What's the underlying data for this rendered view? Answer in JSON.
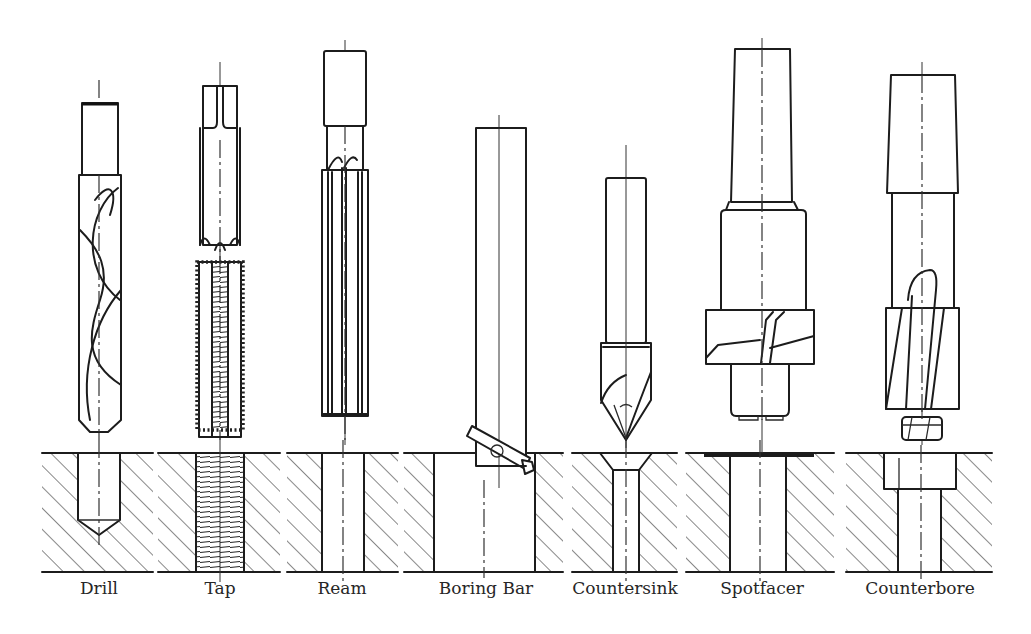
{
  "figure": {
    "title": "",
    "colors": {
      "line": "#1c1c1c",
      "hatch": "#555555",
      "background": "#ffffff",
      "label": "#262626"
    }
  },
  "tools": [
    {
      "id": "drill",
      "label": "Drill",
      "center_x": 99,
      "workpiece_x": [
        42,
        153
      ],
      "hole": "blind hole with conical bottom"
    },
    {
      "id": "tap",
      "label": "Tap",
      "center_x": 220,
      "workpiece_x": [
        158,
        280
      ],
      "hole": "threaded through hole"
    },
    {
      "id": "ream",
      "label": "Ream",
      "center_x": 341,
      "workpiece_x": [
        287,
        398
      ],
      "hole": "reamed through hole"
    },
    {
      "id": "boring-bar",
      "label": "Boring Bar",
      "center_x": 486,
      "workpiece_x": [
        404,
        563
      ],
      "hole": "large bored hole"
    },
    {
      "id": "countersink",
      "label": "Countersink",
      "center_x": 625,
      "workpiece_x": [
        572,
        677
      ],
      "hole": "countersunk hole"
    },
    {
      "id": "spotfacer",
      "label": "Spotfacer",
      "center_x": 762,
      "workpiece_x": [
        686,
        834
      ],
      "hole": "spotfaced hole"
    },
    {
      "id": "counterbore",
      "label": "Counterbore",
      "center_x": 920,
      "workpiece_x": [
        846,
        992
      ],
      "hole": "counterbored hole"
    }
  ],
  "workpiece": {
    "top_y": 453,
    "bottom_y": 572
  }
}
